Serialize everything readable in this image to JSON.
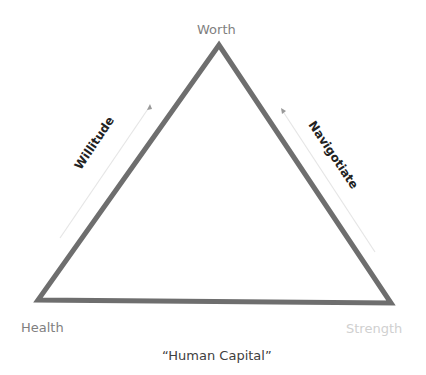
{
  "diagram": {
    "type": "triangle",
    "vertices": {
      "top": "Worth",
      "bottom_left": "Health",
      "bottom_right": "Strength"
    },
    "sides": {
      "left": "Willitude",
      "right": "Navigotiate"
    },
    "caption": "“Human Capital”",
    "colors": {
      "triangle_stroke": "#6e6e6e",
      "arrow_stroke": "#e6e6e6",
      "vertex_label": "#7f7f7f",
      "strength_label": "#d0d0d0",
      "side_label": "#222222",
      "caption": "#404040"
    }
  }
}
